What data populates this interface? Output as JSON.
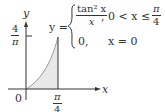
{
  "figure": {
    "axes": {
      "x_label": "x",
      "y_label": "y",
      "origin_label": "0"
    },
    "y_tick": {
      "num": "4",
      "den": "π"
    },
    "x_tick": {
      "num": "π",
      "den": "4"
    },
    "equation": {
      "lhs": "y =",
      "case1_num": "tan² x",
      "case1_den": "x",
      "case1_cond": "0 < x ≤",
      "case1_cond_num": "π",
      "case1_cond_den": "4",
      "case1_comma": ",",
      "case2_value": "0,",
      "case2_cond": "x = 0"
    },
    "colors": {
      "axis": "#333333",
      "curve": "#999999",
      "fill": "#e6e6e6"
    }
  }
}
